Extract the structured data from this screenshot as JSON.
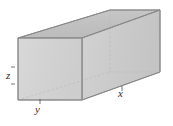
{
  "figure": {
    "name": "rectangular-box",
    "background_color": "#ffffff"
  },
  "labels": {
    "height": "z",
    "depth": "y",
    "length": "x"
  },
  "colors": {
    "top_face": "#c3c3c3",
    "front_face": "#d4d4d4",
    "side_face": "#cbcbcb",
    "outline": "#8a8a8a",
    "hidden_edge": "#b4b4b4",
    "label_text": "#2b2b2b"
  },
  "geometry": {
    "front_top_left": [
      18,
      38
    ],
    "front_top_right": [
      82,
      38
    ],
    "front_bottom_left": [
      18,
      100
    ],
    "front_bottom_right": [
      82,
      100
    ],
    "back_top_left": [
      110,
      10
    ],
    "back_top_right": [
      160,
      10
    ],
    "back_bottom_left": [
      110,
      72
    ],
    "back_bottom_right": [
      160,
      72
    ],
    "x_axis_edge": "front_bottom_right to back_bottom_right",
    "y_axis_edge": "front_bottom_left to front_bottom_right",
    "z_axis_edge": "front_bottom_left to front_top_left"
  }
}
